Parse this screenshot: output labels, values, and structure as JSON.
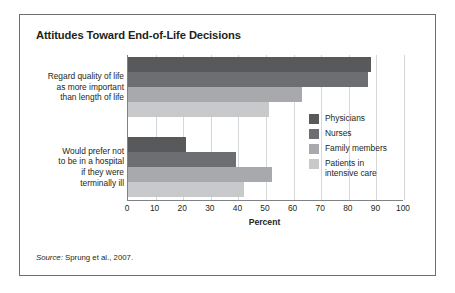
{
  "figure": {
    "title": "Attitudes Toward End-of-Life Decisions",
    "source_prefix": "Source:",
    "source_text": " Sprung et al., 2007."
  },
  "chart_data": {
    "type": "bar",
    "orientation": "horizontal",
    "title": "Attitudes Toward End-of-Life Decisions",
    "xlabel": "Percent",
    "ylabel": "",
    "xlim": [
      0,
      100
    ],
    "xticks": [
      0,
      10,
      20,
      30,
      40,
      50,
      60,
      70,
      80,
      90,
      100
    ],
    "xtick_labels": [
      "0",
      "10",
      "20",
      "30",
      "40",
      "50",
      "60",
      "70",
      "80",
      "90",
      "100"
    ],
    "grid": "vertical",
    "legend_position": "right-inside",
    "categories": [
      "Regard quality of life\nas more important\nthan length of life",
      "Would prefer not\nto be in a hospital\nif they were\nterminally ill"
    ],
    "series": [
      {
        "name": "Physicians",
        "color": "#58595b",
        "values": [
          88,
          21
        ]
      },
      {
        "name": "Nurses",
        "color": "#6d6e71",
        "values": [
          87,
          39
        ]
      },
      {
        "name": "Family members",
        "color": "#a7a9ac",
        "values": [
          63,
          52
        ]
      },
      {
        "name": "Patients in\nintensive care",
        "color": "#c8c9cb",
        "values": [
          51,
          42
        ]
      }
    ]
  },
  "legend": {
    "items": [
      {
        "label": "Physicians",
        "color": "#58595b"
      },
      {
        "label": "Nurses",
        "color": "#6d6e71"
      },
      {
        "label": "Family members",
        "color": "#a7a9ac"
      },
      {
        "label": "Patients in\nintensive care",
        "color": "#c8c9cb"
      }
    ]
  },
  "axis": {
    "tick_labels": [
      "0",
      "10",
      "20",
      "30",
      "40",
      "50",
      "60",
      "70",
      "80",
      "90",
      "100"
    ],
    "title": "Percent"
  },
  "category_labels": [
    "Regard quality of life\nas more important\nthan length of life",
    "Would prefer not\nto be in a hospital\nif they were\nterminally ill"
  ]
}
